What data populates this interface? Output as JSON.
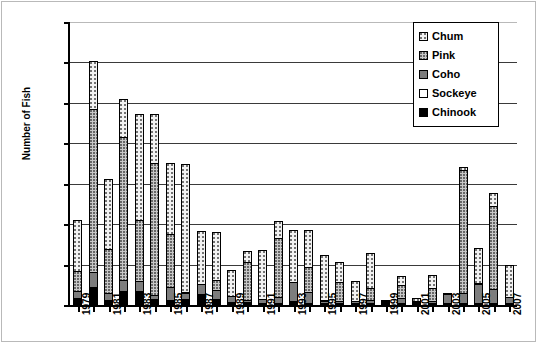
{
  "chart_data": {
    "type": "bar",
    "subtype": "stacked",
    "title": "",
    "xlabel": "",
    "ylabel": "Number of Fish",
    "ylim": [
      0,
      35000
    ],
    "ytick_step": 5000,
    "yticks": [
      0,
      5000,
      10000,
      15000,
      20000,
      25000,
      30000,
      35000
    ],
    "ytick_labels": [
      "0",
      "5000",
      "10000",
      "15000",
      "20000",
      "25000",
      "30000",
      "35000"
    ],
    "grid": true,
    "grid_axis": "y",
    "legend_position": "top-right",
    "categories": [
      1979,
      1980,
      1981,
      1982,
      1983,
      1984,
      1985,
      1986,
      1987,
      1988,
      1989,
      1990,
      1991,
      1992,
      1993,
      1994,
      1995,
      1996,
      1997,
      1998,
      1999,
      2000,
      2001,
      2002,
      2003,
      2004,
      2005,
      2006,
      2007
    ],
    "xtick_labels": [
      "1979",
      "",
      "1981",
      "",
      "1983",
      "",
      "1985",
      "",
      "1987",
      "",
      "1989",
      "",
      "1991",
      "",
      "1993",
      "",
      "1995",
      "",
      "1997",
      "",
      "1999",
      "",
      "2001",
      "",
      "2003",
      "",
      "2005",
      "",
      "2007"
    ],
    "series": [
      {
        "name": "Chinook",
        "swatch": "solid-black",
        "color": "#000000",
        "values": [
          900,
          2200,
          600,
          1700,
          1700,
          700,
          600,
          700,
          1400,
          800,
          400,
          400,
          300,
          300,
          500,
          300,
          200,
          200,
          200,
          200,
          150,
          150,
          100,
          100,
          100,
          300,
          150,
          150,
          150
        ]
      },
      {
        "name": "Sockeye",
        "swatch": "white",
        "color": "#ffffff",
        "values": [
          0,
          0,
          0,
          0,
          0,
          0,
          0,
          0,
          0,
          0,
          0,
          0,
          0,
          0,
          0,
          0,
          0,
          0,
          0,
          0,
          0,
          0,
          0,
          0,
          0,
          0,
          0,
          0,
          0
        ]
      },
      {
        "name": "Coho",
        "swatch": "dark-gray-dotted",
        "color": "#7d7d7d",
        "values": [
          1000,
          2000,
          1000,
          1500,
          1400,
          700,
          1700,
          900,
          1300,
          1200,
          800,
          400,
          600,
          800,
          2500,
          1400,
          400,
          400,
          400,
          500,
          300,
          700,
          300,
          400,
          1200,
          1300,
          2500,
          1800,
          900
        ]
      },
      {
        "name": "Pink",
        "swatch": "mid-gray-dotted",
        "color": "#c8c8c8",
        "values": [
          2500,
          20300,
          5600,
          17800,
          7700,
          16400,
          6700,
          200,
          100,
          1400,
          200,
          4800,
          100,
          7400,
          100,
          3200,
          200,
          2500,
          100,
          1600,
          100,
          1800,
          100,
          1700,
          100,
          15400,
          200,
          10400,
          100
        ]
      },
      {
        "name": "Chum",
        "swatch": "light-dotted",
        "color": "#f2f2f2",
        "values": [
          6500,
          6000,
          8700,
          4900,
          13200,
          6200,
          8900,
          16000,
          6700,
          6000,
          3300,
          1500,
          6100,
          2300,
          6500,
          4700,
          5700,
          2600,
          2600,
          4400,
          300,
          1200,
          500,
          1800,
          300,
          400,
          4500,
          1800,
          4000
        ]
      }
    ],
    "totals": [
      10900,
      30500,
      15900,
      25900,
      24000,
      24000,
      17900,
      17800,
      9500,
      9400,
      4700,
      7100,
      7100,
      10800,
      9600,
      9600,
      6500,
      5700,
      3300,
      6700,
      850,
      3850,
      1000,
      4000,
      1700,
      17400,
      7350,
      14150,
      5150
    ]
  },
  "legend": {
    "items": [
      {
        "label": "Chum"
      },
      {
        "label": "Pink"
      },
      {
        "label": "Coho"
      },
      {
        "label": "Sockeye"
      },
      {
        "label": "Chinook"
      }
    ]
  }
}
